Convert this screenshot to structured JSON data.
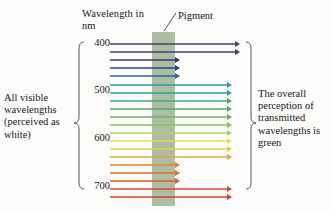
{
  "figure": {
    "axis_title": "Wavelength in nm",
    "pigment_label": "Pigment",
    "left_caption": "All visible wavelengths (perceived as white)",
    "right_caption": "The overall perception of transmitted wavelengths is green",
    "pigment_color": "#8ca37f",
    "pigment_opacity": "0.72",
    "background_color": "#fdfdfc",
    "brace_color": "#54585c"
  },
  "chart_data": {
    "type": "diagram",
    "title": "Wavelength in nm",
    "ylabel": "Wavelength in nm",
    "ylim": [
      400,
      700
    ],
    "grid": false,
    "legend": null,
    "axis_ticks": [
      {
        "label": "400",
        "value": 400,
        "y": 44
      },
      {
        "label": "500",
        "value": 500,
        "y": 91
      },
      {
        "label": "600",
        "value": 600,
        "y": 139
      },
      {
        "label": "700",
        "value": 700,
        "y": 187
      }
    ],
    "pigment_bar": {
      "x": 152,
      "width": 23,
      "y_top": 32,
      "y_bottom": 206
    },
    "ray_start_x": 110,
    "blocked_tip_x": 180,
    "annotations": [
      "All visible wavelengths (perceived as white)",
      "Pigment",
      "The overall perception of transmitted wavelengths is green"
    ],
    "rays": [
      {
        "wavelength": 400,
        "y": 44,
        "color": "#4a3f6e",
        "transmitted": true,
        "tip_x": 240
      },
      {
        "wavelength": 408,
        "y": 52,
        "color": "#443a70",
        "transmitted": true,
        "tip_x": 240
      },
      {
        "wavelength": 417,
        "y": 60,
        "color": "#2d3a7c",
        "transmitted": false,
        "tip_x": 180
      },
      {
        "wavelength": 427,
        "y": 68,
        "color": "#20478f",
        "transmitted": false,
        "tip_x": 180
      },
      {
        "wavelength": 437,
        "y": 76,
        "color": "#1f6aa6",
        "transmitted": false,
        "tip_x": 180
      },
      {
        "wavelength": 458,
        "y": 85,
        "color": "#2e97ad",
        "transmitted": true,
        "tip_x": 232
      },
      {
        "wavelength": 475,
        "y": 93,
        "color": "#2fa08e",
        "transmitted": true,
        "tip_x": 232
      },
      {
        "wavelength": 490,
        "y": 101,
        "color": "#45a87b",
        "transmitted": true,
        "tip_x": 232
      },
      {
        "wavelength": 505,
        "y": 109,
        "color": "#4fad6a",
        "transmitted": true,
        "tip_x": 232
      },
      {
        "wavelength": 520,
        "y": 117,
        "color": "#68b45f",
        "transmitted": true,
        "tip_x": 232
      },
      {
        "wavelength": 535,
        "y": 125,
        "color": "#88c061",
        "transmitted": true,
        "tip_x": 232
      },
      {
        "wavelength": 550,
        "y": 133,
        "color": "#b2d063",
        "transmitted": true,
        "tip_x": 232
      },
      {
        "wavelength": 563,
        "y": 141,
        "color": "#ead95c",
        "transmitted": true,
        "tip_x": 232
      },
      {
        "wavelength": 576,
        "y": 149,
        "color": "#eec94f",
        "transmitted": true,
        "tip_x": 232
      },
      {
        "wavelength": 590,
        "y": 157,
        "color": "#e3a646",
        "transmitted": true,
        "tip_x": 232
      },
      {
        "wavelength": 610,
        "y": 165,
        "color": "#e08339",
        "transmitted": false,
        "tip_x": 180
      },
      {
        "wavelength": 625,
        "y": 173,
        "color": "#dd6f31",
        "transmitted": false,
        "tip_x": 180
      },
      {
        "wavelength": 640,
        "y": 181,
        "color": "#db5c2c",
        "transmitted": false,
        "tip_x": 180
      },
      {
        "wavelength": 670,
        "y": 189,
        "color": "#d9482c",
        "transmitted": true,
        "tip_x": 232
      },
      {
        "wavelength": 700,
        "y": 197,
        "color": "#d8402c",
        "transmitted": true,
        "tip_x": 232
      }
    ]
  }
}
